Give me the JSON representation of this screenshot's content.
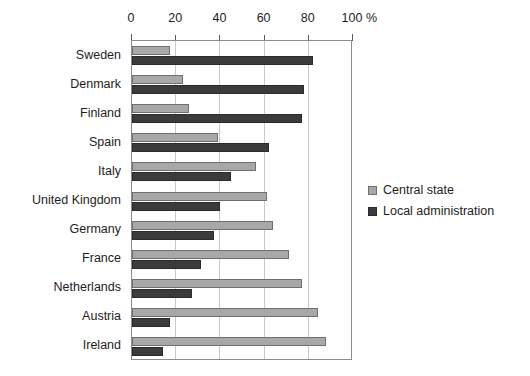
{
  "chart_data": {
    "type": "bar",
    "orientation": "horizontal",
    "title": "",
    "xlabel": "%",
    "ylabel": "",
    "xlim": [
      0,
      100
    ],
    "xticks": [
      0,
      20,
      40,
      60,
      80,
      100
    ],
    "grid": true,
    "legend_position": "right",
    "categories": [
      "Sweden",
      "Denmark",
      "Finland",
      "Spain",
      "Italy",
      "United Kingdom",
      "Germany",
      "France",
      "Netherlands",
      "Austria",
      "Ireland"
    ],
    "series": [
      {
        "name": "Central state",
        "color": "#a8a8a8",
        "values": [
          17,
          23,
          26,
          39,
          56,
          61,
          64,
          71,
          77,
          84,
          88
        ]
      },
      {
        "name": "Local administration",
        "color": "#3b3b3b",
        "values": [
          82,
          78,
          77,
          62,
          45,
          40,
          37,
          31,
          27,
          17,
          14
        ]
      }
    ]
  },
  "axis": {
    "unit_label": "%"
  },
  "legend": {
    "entries": [
      {
        "label": "Central state",
        "swatch": "light-gray-square"
      },
      {
        "label": "Local administration",
        "swatch": "dark-gray-square"
      }
    ]
  }
}
